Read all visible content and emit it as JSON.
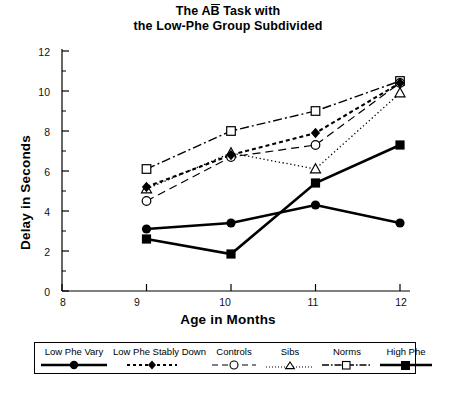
{
  "chart_data": {
    "type": "line",
    "title_line1_pre": "The A",
    "title_line1_overbar": "B",
    "title_line1_post": " Task with",
    "title_line2": "the Low-Phe Group Subdivided",
    "xlabel": "Age in Months",
    "ylabel": "Delay in Seconds",
    "x": [
      9,
      10,
      11,
      12
    ],
    "xlim": [
      8,
      12
    ],
    "ylim": [
      0,
      12
    ],
    "xticks": [
      "8",
      "9",
      "10",
      "11",
      "12"
    ],
    "yticks": [
      "0",
      "2",
      "4",
      "6",
      "8",
      "10",
      "12"
    ],
    "xtick_values": [
      8,
      9,
      10,
      11,
      12
    ],
    "ytick_values": [
      0,
      2,
      4,
      6,
      8,
      10,
      12
    ],
    "yminor_values": [
      1,
      3,
      5,
      7,
      9,
      11
    ],
    "grid": false,
    "legend_position": "below-axes",
    "series": [
      {
        "name": "Low Phe Vary",
        "values": [
          3.1,
          3.4,
          4.3,
          3.4
        ],
        "marker": "filled-circle",
        "line": "solid",
        "color": "#000000"
      },
      {
        "name": "Low Phe Stably Down",
        "values": [
          5.2,
          6.8,
          7.9,
          10.4
        ],
        "marker": "filled-diamond",
        "line": "dashed",
        "color": "#000000"
      },
      {
        "name": "Controls",
        "values": [
          4.5,
          6.7,
          7.3,
          10.4
        ],
        "marker": "open-circle",
        "line": "long-dashed",
        "color": "#000000"
      },
      {
        "name": "Sibs",
        "values": [
          5.1,
          6.9,
          6.1,
          9.9
        ],
        "marker": "open-triangle",
        "line": "dotted",
        "color": "#000000"
      },
      {
        "name": "Norms",
        "values": [
          6.1,
          8.0,
          9.0,
          10.5
        ],
        "marker": "open-square",
        "line": "dash-dot",
        "color": "#000000"
      },
      {
        "name": "High Phe",
        "values": [
          2.6,
          1.85,
          5.4,
          7.3
        ],
        "marker": "filled-square",
        "line": "solid-thick",
        "color": "#000000"
      }
    ]
  },
  "legend": {
    "items": [
      {
        "label": "Low Phe Vary"
      },
      {
        "label": "Low Phe Stably Down"
      },
      {
        "label": "Controls"
      },
      {
        "label": "Sibs"
      },
      {
        "label": "Norms"
      },
      {
        "label": "High Phe"
      }
    ]
  }
}
